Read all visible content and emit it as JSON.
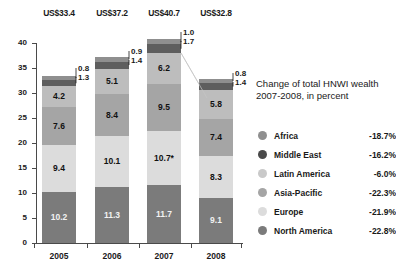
{
  "chart_data": {
    "type": "bar",
    "subtype": "stacked-column",
    "title": "",
    "xlabel": "",
    "ylabel": "",
    "ylim": [
      0,
      40
    ],
    "ytick_values": [
      0,
      5,
      10,
      15,
      20,
      25,
      30,
      35,
      40
    ],
    "ytick_labels": [
      "0",
      "5",
      "10",
      "15",
      "20",
      "25",
      "30",
      "35",
      "40"
    ],
    "grid": false,
    "legend_position": "right",
    "categories": [
      "2005",
      "2006",
      "2007",
      "2008"
    ],
    "totals": [
      "US$33.4",
      "US$37.2",
      "US$40.7",
      "US$32.8"
    ],
    "total_values": [
      33.4,
      37.2,
      40.7,
      32.8
    ],
    "series": [
      {
        "name": "North America",
        "values": [
          10.2,
          11.3,
          11.7,
          9.1
        ],
        "labels": [
          "10.2",
          "11.3",
          "11.7",
          "9.1"
        ],
        "color": "#7b7b7b"
      },
      {
        "name": "Europe",
        "values": [
          9.4,
          10.1,
          10.7,
          8.3
        ],
        "labels": [
          "9.4",
          "10.1",
          "10.7*",
          "8.3"
        ],
        "color": "#dcdcdc"
      },
      {
        "name": "Asia-Pacific",
        "values": [
          7.6,
          8.4,
          9.5,
          7.4
        ],
        "labels": [
          "7.6",
          "8.4",
          "9.5",
          "7.4"
        ],
        "color": "#a5a5a5"
      },
      {
        "name": "Latin America",
        "values": [
          4.2,
          5.1,
          6.2,
          5.8
        ],
        "labels": [
          "4.2",
          "5.1",
          "6.2",
          "5.8"
        ],
        "color": "#bdbdbd"
      },
      {
        "name": "Middle East",
        "values": [
          1.3,
          1.4,
          1.7,
          1.4
        ],
        "labels": [
          "1.3",
          "1.4",
          "1.7",
          "1.4"
        ],
        "color": "#5e5e5e"
      },
      {
        "name": "Africa",
        "values": [
          0.8,
          0.9,
          1.0,
          0.8
        ],
        "labels": [
          "0.8",
          "0.9",
          "1.0",
          "0.8"
        ],
        "color": "#8f8f8f"
      }
    ],
    "callouts": [
      {
        "bar": 0,
        "series": "Africa",
        "label": "0.8"
      },
      {
        "bar": 0,
        "series": "Middle East",
        "label": "1.3"
      },
      {
        "bar": 1,
        "series": "Africa",
        "label": "0.9"
      },
      {
        "bar": 1,
        "series": "Middle East",
        "label": "1.4"
      },
      {
        "bar": 2,
        "series": "Africa",
        "label": "1.0"
      },
      {
        "bar": 2,
        "series": "Middle East",
        "label": "1.7"
      },
      {
        "bar": 3,
        "series": "Africa",
        "label": "0.8"
      },
      {
        "bar": 3,
        "series": "Middle East",
        "label": "1.4"
      }
    ],
    "footnote_marker": "*"
  },
  "legend": {
    "title_line1": "Change of total HNWI wealth",
    "title_line2": "2007-2008, in percent",
    "rows": [
      {
        "name": "Africa",
        "value": "-18.7%",
        "color": "#8f8f8f"
      },
      {
        "name": "Middle East",
        "value": "-16.2%",
        "color": "#4a4a4a"
      },
      {
        "name": "Latin America",
        "value": "-6.0%",
        "color": "#c9c9c9"
      },
      {
        "name": "Asia-Pacific",
        "value": "-22.3%",
        "color": "#a5a5a5"
      },
      {
        "name": "Europe",
        "value": "-21.9%",
        "color": "#dcdcdc"
      },
      {
        "name": "North America",
        "value": "-22.8%",
        "color": "#7b7b7b"
      }
    ]
  },
  "axis": {
    "y_labels": [
      "40",
      "35",
      "30",
      "25",
      "20",
      "15",
      "10",
      "5",
      "0"
    ],
    "x_labels": [
      "2005",
      "2006",
      "2007",
      "2008"
    ]
  },
  "totals_row": {
    "items": [
      "US$33.4",
      "US$37.2",
      "US$40.7",
      "US$32.8"
    ]
  }
}
